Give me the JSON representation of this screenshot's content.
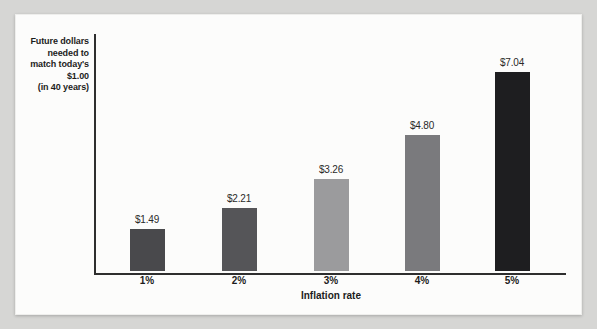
{
  "page": {
    "background_color": "#d6d6d4",
    "panel_background_color": "#fcfcfb"
  },
  "chart_data": {
    "type": "bar",
    "title": "",
    "categories": [
      "1%",
      "2%",
      "3%",
      "4%",
      "5%"
    ],
    "values": [
      1.49,
      2.21,
      3.26,
      4.8,
      7.04
    ],
    "value_labels": [
      "$1.49",
      "$2.21",
      "$3.26",
      "$4.80",
      "$7.04"
    ],
    "xlabel": "Inflation rate",
    "ylabel": "Future dollars needed to match today's $1.00 (in 40 years)",
    "ylabel_lines": [
      "Future dollars",
      "needed to",
      "match today's",
      "$1.00",
      "(in 40 years)"
    ],
    "bar_colors": [
      "#49494c",
      "#555558",
      "#9b9b9d",
      "#7a7a7d",
      "#1e1e20"
    ],
    "axis_color": "#2e2e2e",
    "text_color": "#1c1c1c",
    "ylim": [
      0,
      7.5
    ],
    "grid": false,
    "legend": "none"
  }
}
